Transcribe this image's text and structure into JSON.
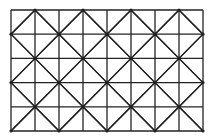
{
  "diagram": {
    "type": "grid-with-diagonals",
    "background": "#ffffff",
    "line_color": "#222222",
    "grid": {
      "x0": 11,
      "y0": 10,
      "cols": 8,
      "rows": 5,
      "cell_w": 24,
      "cell_h": 24.2
    },
    "diagonal_period_cells": 2,
    "node_dot_radius": 1.6
  }
}
